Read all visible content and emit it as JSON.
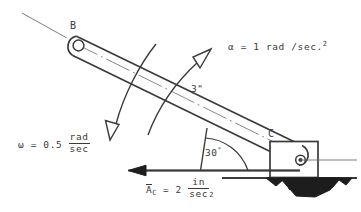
{
  "figure": {
    "ink_color": "#3a3a3a",
    "background_color": "#ffffff",
    "width": 361,
    "height": 212
  },
  "points": {
    "b_label": "B",
    "c_label": "C"
  },
  "dimension": {
    "length_label": "3\""
  },
  "angle": {
    "value": "30",
    "unit": "°"
  },
  "alpha": {
    "symbol": "α",
    "equals": "=",
    "value": "1",
    "unit": "rad /sec.",
    "exponent": "2"
  },
  "omega": {
    "symbol": "ω",
    "equals": "=",
    "value": "0.5",
    "numerator": "rad",
    "denominator": "sec"
  },
  "acceleration": {
    "symbol": "A",
    "subscript": "C",
    "equals": "=",
    "value": "2",
    "numerator": "in",
    "denominator": "sec",
    "exponent": "2"
  }
}
